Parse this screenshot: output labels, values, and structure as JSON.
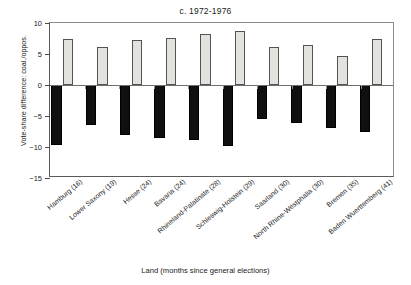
{
  "chart_data": {
    "type": "bar",
    "title": "c. 1972-1976",
    "xlabel": "Land (months since general elections)",
    "ylabel": "Vote-share difference: coal./oppos.",
    "ylim": [
      -15,
      10
    ],
    "yticks": [
      10,
      5,
      0,
      -5,
      -10,
      -15
    ],
    "ytick_labels": [
      "10",
      "5",
      "0",
      "−5",
      "−10",
      "−15"
    ],
    "grid": false,
    "legend": "none",
    "categories": [
      "Hamburg (16)",
      "Lower Saxony (19)",
      "Hesse (24)",
      "Bavaria (24)",
      "Rhineland-Palatinate (28)",
      "Schleswig-Holstein (29)",
      "Saarland (30)",
      "North Rhine-Westphalia (30)",
      "Bremen (35)",
      "Baden Wuerttemberg (41)"
    ],
    "series": [
      {
        "name": "positive",
        "color": "#e2e2de",
        "values": [
          7.4,
          6.2,
          7.2,
          7.6,
          8.3,
          8.7,
          6.1,
          6.5,
          4.7,
          7.4
        ]
      },
      {
        "name": "negative",
        "color": "#111010",
        "values": [
          -9.7,
          -6.4,
          -8.0,
          -8.5,
          -8.8,
          -9.8,
          -5.5,
          -6.1,
          -7.0,
          -7.5
        ]
      }
    ]
  }
}
